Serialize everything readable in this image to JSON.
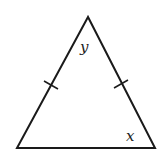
{
  "diagram": {
    "type": "isosceles-triangle",
    "vertices": {
      "apex": [
        88,
        17
      ],
      "bottom_left": [
        17,
        148
      ],
      "bottom_right": [
        155,
        148
      ]
    },
    "tick_marks": [
      {
        "side": "left",
        "center": [
          51,
          85
        ]
      },
      {
        "side": "right",
        "center": [
          121,
          84
        ]
      }
    ],
    "labels": {
      "apex_angle": "y",
      "base_right_angle": "x"
    },
    "colors": {
      "stroke": "#1a1a1a",
      "background": "#ffffff"
    }
  }
}
